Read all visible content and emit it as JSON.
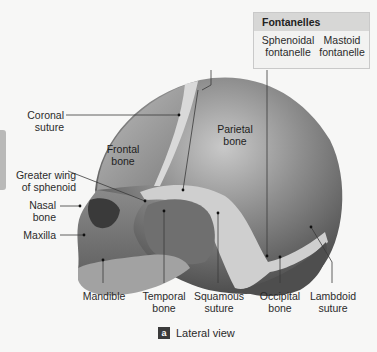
{
  "legend": {
    "title": "Fontanelles",
    "items": [
      {
        "line1": "Sphenoidal",
        "line2": "fontanelle"
      },
      {
        "line1": "Mastoid",
        "line2": "fontanelle"
      }
    ]
  },
  "labels": {
    "coronal_suture": {
      "line1": "Coronal",
      "line2": "suture"
    },
    "frontal_bone": {
      "line1": "Frontal",
      "line2": "bone"
    },
    "parietal_bone": {
      "line1": "Parietal",
      "line2": "bone"
    },
    "greater_wing": {
      "line1": "Greater wing",
      "line2": "of sphenoid"
    },
    "nasal_bone": {
      "line1": "Nasal",
      "line2": "bone"
    },
    "maxilla": {
      "line1": "Maxilla"
    },
    "mandible": {
      "line1": "Mandible"
    },
    "temporal_bone": {
      "line1": "Temporal",
      "line2": "bone"
    },
    "squamous_suture": {
      "line1": "Squamous",
      "line2": "suture"
    },
    "occipital_bone": {
      "line1": "Occipital",
      "line2": "bone"
    },
    "lambdoid_suture": {
      "line1": "Lambdoid",
      "line2": "suture"
    }
  },
  "caption": {
    "badge": "a",
    "text": "Lateral view"
  }
}
